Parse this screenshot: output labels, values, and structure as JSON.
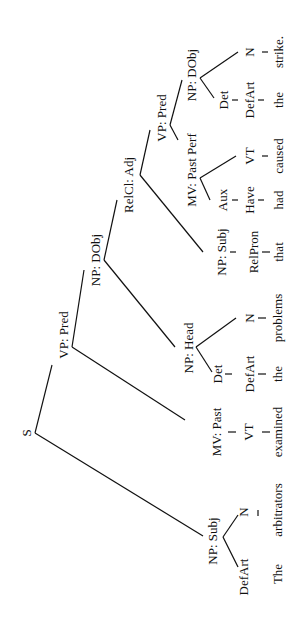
{
  "diagram": {
    "type": "syntax-tree",
    "orientation": "rotated-90-ccw",
    "nodes": {
      "s": "S",
      "np_subj": "NP: Subj",
      "defart1": "DefArt",
      "n1": "N",
      "vp_pred": "VP: Pred",
      "mv_past": "MV: Past",
      "vt1": "VT",
      "np_dobj": "NP: DObj",
      "np_head": "NP: Head",
      "det1": "Det",
      "defart2": "DefArt",
      "n2": "N",
      "relcl_adj": "RelCl: Adj",
      "np_subj2": "NP: Subj",
      "relpron": "RelPron",
      "vp_pred2": "VP: Pred",
      "mv_pastperf": "MV: Past Perf",
      "aux": "Aux",
      "have": "Have",
      "vt2": "VT",
      "np_dobj2": "NP: DObj",
      "det2": "Det",
      "defart3": "DefArt",
      "n3": "N"
    },
    "words": [
      "The",
      "arbitrators",
      "examined",
      "the",
      "problems",
      "that",
      "had",
      "caused",
      "the",
      "strike."
    ]
  }
}
